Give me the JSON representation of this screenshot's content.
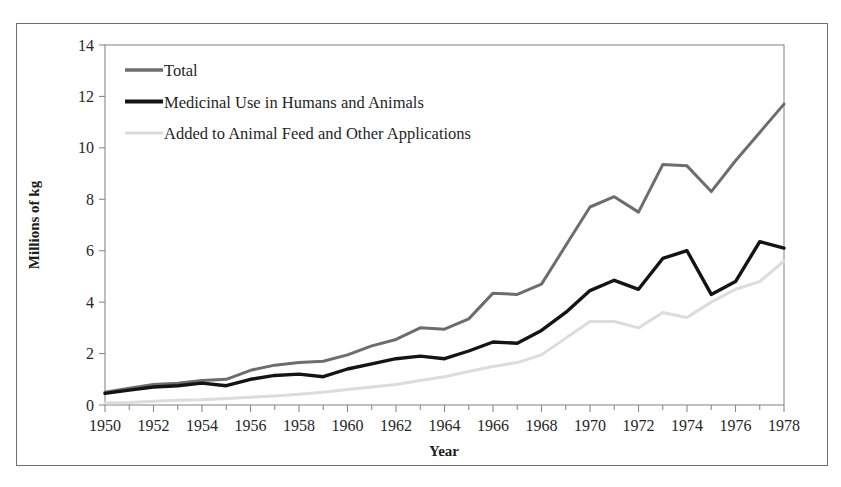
{
  "chart_data": {
    "type": "line",
    "title": "",
    "xlabel": "Year",
    "ylabel": "Millions of kg",
    "xlim": [
      1950,
      1978
    ],
    "ylim": [
      0,
      14
    ],
    "ytick_step": 2,
    "yticks": [
      "0",
      "2",
      "4",
      "6",
      "8",
      "10",
      "12",
      "14"
    ],
    "xticks": [
      "1950",
      "1952",
      "1954",
      "1956",
      "1958",
      "1960",
      "1962",
      "1964",
      "1966",
      "1968",
      "1970",
      "1972",
      "1974",
      "1976",
      "1978"
    ],
    "xtick_minor_step": 1,
    "grid": false,
    "legend_position": "top-left",
    "x": [
      1950,
      1951,
      1952,
      1953,
      1954,
      1955,
      1956,
      1957,
      1958,
      1959,
      1960,
      1961,
      1962,
      1963,
      1964,
      1965,
      1966,
      1967,
      1968,
      1969,
      1970,
      1971,
      1972,
      1973,
      1974,
      1975,
      1976,
      1977,
      1978
    ],
    "series": [
      {
        "name": "Total",
        "color": "#6d6d6d",
        "width": 3.0,
        "values": [
          0.5,
          0.65,
          0.8,
          0.85,
          0.95,
          1.0,
          1.35,
          1.55,
          1.65,
          1.7,
          1.95,
          2.3,
          2.55,
          3.0,
          2.95,
          3.35,
          4.35,
          4.3,
          4.7,
          6.2,
          7.7,
          8.1,
          7.5,
          9.35,
          9.3,
          8.3,
          9.5,
          10.6,
          11.7
        ]
      },
      {
        "name": "Medicinal Use in Humans and Animals",
        "color": "#141414",
        "width": 3.4,
        "values": [
          0.45,
          0.58,
          0.7,
          0.75,
          0.85,
          0.75,
          1.0,
          1.15,
          1.2,
          1.1,
          1.4,
          1.6,
          1.8,
          1.9,
          1.8,
          2.1,
          2.45,
          2.4,
          2.9,
          3.6,
          4.45,
          4.85,
          4.5,
          5.7,
          6.0,
          4.3,
          4.8,
          6.35,
          6.1
        ]
      },
      {
        "name": "Added to Animal Feed and Other Applications",
        "color": "#dcdcdc",
        "width": 3.0,
        "values": [
          0.08,
          0.1,
          0.15,
          0.18,
          0.2,
          0.25,
          0.3,
          0.35,
          0.42,
          0.5,
          0.6,
          0.7,
          0.8,
          0.95,
          1.1,
          1.3,
          1.5,
          1.65,
          1.95,
          2.6,
          3.25,
          3.25,
          3.0,
          3.6,
          3.4,
          4.0,
          4.5,
          4.8,
          5.6
        ]
      }
    ]
  },
  "legend": {
    "items": [
      {
        "label": "Total",
        "color": "#6d6d6d"
      },
      {
        "label": "Medicinal Use in Humans and Animals",
        "color": "#141414"
      },
      {
        "label": "Added to Animal Feed and Other Applications",
        "color": "#dcdcdc"
      }
    ]
  }
}
